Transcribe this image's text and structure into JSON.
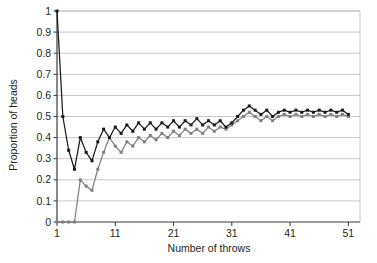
{
  "chart_data": {
    "type": "line",
    "title": "",
    "subtitle": "",
    "xlabel": "Number of throws",
    "ylabel": "Proportion of heads",
    "xlim": [
      1,
      53
    ],
    "ylim": [
      0,
      1
    ],
    "xticks": [
      1,
      11,
      21,
      31,
      41,
      51
    ],
    "xtick_labels": [
      "1",
      "11",
      "21",
      "31",
      "41",
      "51"
    ],
    "yticks": [
      0,
      0.1,
      0.2,
      0.3,
      0.4,
      0.5,
      0.6,
      0.7,
      0.8,
      0.9,
      1
    ],
    "ytick_labels": [
      "0",
      "0.1",
      "0.2",
      "0.3",
      "0.4",
      "0.5",
      "0.6",
      "0.7",
      "0.8",
      "0.9",
      "1"
    ],
    "grid": "horizontal",
    "legend": "none",
    "x": [
      1,
      2,
      3,
      4,
      5,
      6,
      7,
      8,
      9,
      10,
      11,
      12,
      13,
      14,
      15,
      16,
      17,
      18,
      19,
      20,
      21,
      22,
      23,
      24,
      25,
      26,
      27,
      28,
      29,
      30,
      31,
      32,
      33,
      34,
      35,
      36,
      37,
      38,
      39,
      40,
      41,
      42,
      43,
      44,
      45,
      46,
      47,
      48,
      49,
      50,
      51
    ],
    "series": [
      {
        "name": "Series 1",
        "color": "#1a1a1a",
        "marker": "square",
        "values": [
          1.0,
          0.5,
          0.34,
          0.25,
          0.4,
          0.33,
          0.29,
          0.38,
          0.44,
          0.4,
          0.45,
          0.42,
          0.46,
          0.43,
          0.47,
          0.44,
          0.47,
          0.44,
          0.47,
          0.45,
          0.48,
          0.45,
          0.48,
          0.46,
          0.49,
          0.46,
          0.48,
          0.46,
          0.48,
          0.45,
          0.47,
          0.5,
          0.53,
          0.55,
          0.53,
          0.51,
          0.53,
          0.5,
          0.52,
          0.53,
          0.52,
          0.53,
          0.52,
          0.53,
          0.52,
          0.53,
          0.52,
          0.53,
          0.52,
          0.53,
          0.51
        ]
      },
      {
        "name": "Series 2",
        "color": "#808080",
        "marker": "square",
        "values": [
          0.0,
          0.0,
          0.0,
          0.0,
          0.2,
          0.17,
          0.15,
          0.25,
          0.33,
          0.4,
          0.36,
          0.33,
          0.38,
          0.36,
          0.4,
          0.38,
          0.41,
          0.39,
          0.42,
          0.4,
          0.43,
          0.41,
          0.44,
          0.42,
          0.44,
          0.42,
          0.45,
          0.43,
          0.45,
          0.44,
          0.46,
          0.48,
          0.5,
          0.52,
          0.5,
          0.48,
          0.5,
          0.48,
          0.5,
          0.51,
          0.5,
          0.51,
          0.5,
          0.51,
          0.5,
          0.51,
          0.5,
          0.51,
          0.5,
          0.51,
          0.5
        ]
      }
    ]
  }
}
